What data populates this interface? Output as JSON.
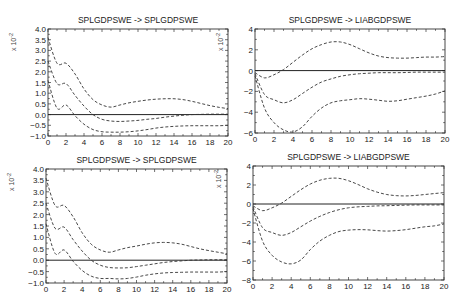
{
  "chart_data": [
    {
      "type": "line",
      "title": "SPLGDPSWE -> SPLGDPSWE",
      "xlabel": "",
      "ylabel": "x 10^-2",
      "xlim": [
        0,
        20
      ],
      "ylim": [
        -1.0,
        4.0
      ],
      "xticks": [
        0,
        2,
        4,
        6,
        8,
        10,
        12,
        14,
        16,
        18,
        20
      ],
      "yticks": [
        -1.0,
        -0.5,
        0.0,
        0.5,
        1.0,
        1.5,
        2.0,
        2.5,
        3.0,
        3.5,
        4.0
      ],
      "ytick_labels": [
        "-1.0",
        "-0.5",
        "0.0",
        "0.5",
        "1.0",
        "1.5",
        "2.0",
        "2.5",
        "3.0",
        "3.5",
        "4.0"
      ],
      "grid": false,
      "x": [
        0,
        1,
        2,
        3,
        4,
        5,
        6,
        7,
        8,
        9,
        10,
        11,
        12,
        13,
        14,
        15,
        16,
        17,
        18,
        19,
        20
      ],
      "series": [
        {
          "name": "upper",
          "values": [
            3.6,
            2.4,
            2.4,
            1.9,
            1.2,
            0.7,
            0.45,
            0.35,
            0.45,
            0.55,
            0.62,
            0.68,
            0.72,
            0.74,
            0.74,
            0.7,
            0.62,
            0.52,
            0.42,
            0.34,
            0.28
          ]
        },
        {
          "name": "median",
          "values": [
            2.5,
            1.45,
            1.45,
            0.9,
            0.4,
            0.0,
            -0.22,
            -0.3,
            -0.32,
            -0.3,
            -0.27,
            -0.22,
            -0.18,
            -0.12,
            -0.07,
            -0.03,
            0.0,
            0.01,
            0.02,
            0.02,
            0.02
          ]
        },
        {
          "name": "lower",
          "values": [
            1.6,
            0.3,
            0.45,
            -0.05,
            -0.45,
            -0.7,
            -0.8,
            -0.82,
            -0.82,
            -0.8,
            -0.76,
            -0.7,
            -0.63,
            -0.58,
            -0.55,
            -0.53,
            -0.52,
            -0.52,
            -0.52,
            -0.52,
            -0.5
          ]
        }
      ]
    },
    {
      "type": "line",
      "title": "SPLGDPSWE -> LIABGDPSWE",
      "xlabel": "",
      "ylabel": "x 10^-2",
      "xlim": [
        0,
        20
      ],
      "ylim": [
        -6,
        4
      ],
      "xticks": [
        0,
        2,
        4,
        6,
        8,
        10,
        12,
        14,
        16,
        18,
        20
      ],
      "yticks": [
        -6,
        -4,
        -2,
        0,
        2,
        4
      ],
      "ytick_labels": [
        "-6",
        "-4",
        "-2",
        "0",
        "2",
        "4"
      ],
      "grid": false,
      "x": [
        0,
        1,
        2,
        3,
        4,
        5,
        6,
        7,
        8,
        9,
        10,
        11,
        12,
        13,
        14,
        15,
        16,
        17,
        18,
        19,
        20
      ],
      "series": [
        {
          "name": "upper",
          "values": [
            -0.2,
            -0.7,
            -0.4,
            0.1,
            0.8,
            1.5,
            2.1,
            2.5,
            2.75,
            2.75,
            2.5,
            2.1,
            1.7,
            1.4,
            1.25,
            1.2,
            1.2,
            1.25,
            1.3,
            1.3,
            1.35
          ]
        },
        {
          "name": "median",
          "values": [
            -0.3,
            -2.3,
            -2.8,
            -3.1,
            -2.8,
            -2.2,
            -1.6,
            -1.1,
            -0.8,
            -0.55,
            -0.4,
            -0.3,
            -0.25,
            -0.2,
            -0.2,
            -0.2,
            -0.18,
            -0.15,
            -0.15,
            -0.15,
            -0.15
          ]
        },
        {
          "name": "lower",
          "values": [
            -0.5,
            -3.6,
            -5.0,
            -5.7,
            -5.9,
            -5.4,
            -4.4,
            -3.6,
            -3.1,
            -2.9,
            -2.8,
            -2.7,
            -2.75,
            -2.85,
            -2.95,
            -2.9,
            -2.75,
            -2.6,
            -2.45,
            -2.25,
            -1.95
          ]
        }
      ]
    },
    {
      "type": "line",
      "title": "SPLGDPSWE -> SPLGDPSWE",
      "xlabel": "",
      "ylabel": "x 10^-2",
      "xlim": [
        0,
        20
      ],
      "ylim": [
        -1.0,
        4.0
      ],
      "xticks": [
        0,
        2,
        4,
        6,
        8,
        10,
        12,
        14,
        16,
        18,
        20
      ],
      "yticks": [
        -1.0,
        -0.5,
        0.0,
        0.5,
        1.0,
        1.5,
        2.0,
        2.5,
        3.0,
        3.5,
        4.0
      ],
      "ytick_labels": [
        "-1.0",
        "-0.5",
        "0.0",
        "0.5",
        "1.0",
        "1.5",
        "2.0",
        "2.5",
        "3.0",
        "3.5",
        "4.0"
      ],
      "grid": false,
      "x": [
        0,
        1,
        2,
        3,
        4,
        5,
        6,
        7,
        8,
        9,
        10,
        11,
        12,
        13,
        14,
        15,
        16,
        17,
        18,
        19,
        20
      ],
      "series": [
        {
          "name": "upper",
          "values": [
            3.6,
            2.4,
            2.4,
            1.9,
            1.2,
            0.7,
            0.45,
            0.35,
            0.45,
            0.55,
            0.62,
            0.7,
            0.76,
            0.78,
            0.76,
            0.7,
            0.6,
            0.5,
            0.42,
            0.35,
            0.28
          ]
        },
        {
          "name": "median",
          "values": [
            2.5,
            1.4,
            1.45,
            0.9,
            0.4,
            0.0,
            -0.22,
            -0.32,
            -0.34,
            -0.33,
            -0.28,
            -0.22,
            -0.16,
            -0.1,
            -0.06,
            -0.03,
            0.0,
            0.01,
            0.02,
            0.02,
            0.02
          ]
        },
        {
          "name": "lower",
          "values": [
            1.6,
            0.3,
            0.45,
            -0.05,
            -0.45,
            -0.7,
            -0.8,
            -0.8,
            -0.82,
            -0.8,
            -0.74,
            -0.66,
            -0.6,
            -0.56,
            -0.54,
            -0.53,
            -0.52,
            -0.52,
            -0.52,
            -0.52,
            -0.5
          ]
        }
      ]
    },
    {
      "type": "line",
      "title": "SPLGDPSWE -> LIABGDPSWE",
      "xlabel": "",
      "ylabel": "x 10^-2",
      "xlim": [
        0,
        20
      ],
      "ylim": [
        -8,
        4
      ],
      "xticks": [
        0,
        2,
        4,
        6,
        8,
        10,
        12,
        14,
        16,
        18,
        20
      ],
      "yticks": [
        -8,
        -6,
        -4,
        -2,
        0,
        2,
        4
      ],
      "ytick_labels": [
        "-8",
        "-6",
        "-4",
        "-2",
        "0",
        "2",
        "4"
      ],
      "grid": false,
      "x": [
        0,
        1,
        2,
        3,
        4,
        5,
        6,
        7,
        8,
        9,
        10,
        11,
        12,
        13,
        14,
        15,
        16,
        17,
        18,
        19,
        20
      ],
      "series": [
        {
          "name": "upper",
          "values": [
            -0.2,
            -0.7,
            -0.4,
            0.1,
            0.8,
            1.5,
            2.1,
            2.5,
            2.7,
            2.7,
            2.45,
            2.05,
            1.6,
            1.25,
            1.0,
            0.88,
            0.85,
            0.9,
            1.0,
            1.1,
            1.2
          ]
        },
        {
          "name": "median",
          "values": [
            -0.3,
            -2.5,
            -3.0,
            -3.3,
            -3.0,
            -2.4,
            -1.8,
            -1.3,
            -0.9,
            -0.6,
            -0.4,
            -0.3,
            -0.25,
            -0.2,
            -0.18,
            -0.15,
            -0.12,
            -0.1,
            -0.1,
            -0.1,
            -0.1
          ]
        },
        {
          "name": "lower",
          "values": [
            -0.5,
            -3.9,
            -5.4,
            -6.1,
            -6.3,
            -5.9,
            -4.8,
            -3.9,
            -3.3,
            -2.9,
            -2.75,
            -2.7,
            -2.72,
            -2.8,
            -2.85,
            -2.8,
            -2.7,
            -2.55,
            -2.4,
            -2.3,
            -2.1
          ]
        }
      ]
    }
  ],
  "panels": [
    {
      "title": "SPLGDPSWE -> SPLGDPSWE",
      "exponent_label": "x 10",
      "exponent_power": "-2"
    },
    {
      "title": "SPLGDPSWE -> LIABGDPSWE",
      "exponent_label": "x 10",
      "exponent_power": "-2"
    },
    {
      "title": "SPLGDPSWE -> SPLGDPSWE",
      "exponent_label": "x 10",
      "exponent_power": "-2"
    },
    {
      "title": "SPLGDPSWE -> LIABGDPSWE",
      "exponent_label": "x 10",
      "exponent_power": "-2"
    }
  ]
}
